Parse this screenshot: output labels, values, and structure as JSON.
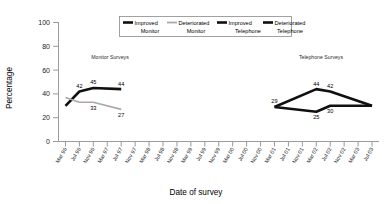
{
  "chart_data": {
    "type": "line",
    "title": "",
    "xlabel": "Date of survey",
    "ylabel": "Percentage",
    "ylim": [
      0,
      100
    ],
    "yticks": [
      0,
      20,
      40,
      60,
      80,
      100
    ],
    "grid": false,
    "legend_position": "top-center",
    "x": [
      "Mar 96",
      "Jul 96",
      "Nov 96",
      "Mar 97",
      "Jul 97",
      "Nov 97",
      "Mar 98",
      "Jul 98",
      "Nov 98",
      "Mar 99",
      "Jul 99",
      "Nov 99",
      "Mar 00",
      "Jul 00",
      "Nov 00",
      "Mar 01",
      "Jul 01",
      "Nov 01",
      "Mar 02",
      "Jul 02",
      "Nov 02",
      "Mar 03",
      "Jul 03"
    ],
    "annotations": [
      {
        "text": "Monitor Surveys",
        "x": "Nov 96"
      },
      {
        "text": "Telephone Surveys",
        "x": "Nov 01"
      }
    ],
    "series": [
      {
        "name": "Improved Monitor",
        "style": "thick-black",
        "points": [
          {
            "x": "Mar 96",
            "y": 30,
            "label": ""
          },
          {
            "x": "Jul 96",
            "y": 42,
            "label": "42"
          },
          {
            "x": "Nov 96",
            "y": 45,
            "label": "45"
          },
          {
            "x": "Jul 97",
            "y": 44,
            "label": "44"
          }
        ]
      },
      {
        "name": "Deteriorated Monitor",
        "style": "thin-grey",
        "points": [
          {
            "x": "Mar 96",
            "y": 37,
            "label": ""
          },
          {
            "x": "Jul 96",
            "y": 33,
            "label": ""
          },
          {
            "x": "Nov 96",
            "y": 33,
            "label": "33"
          },
          {
            "x": "Jul 97",
            "y": 27,
            "label": "27"
          }
        ]
      },
      {
        "name": "Improved Telephone",
        "style": "thick-black",
        "points": [
          {
            "x": "Mar 01",
            "y": 29,
            "label": "29"
          },
          {
            "x": "Mar 02",
            "y": 44,
            "label": "44"
          },
          {
            "x": "Jul 02",
            "y": 42,
            "label": "42"
          },
          {
            "x": "Jul 03",
            "y": 30,
            "label": ""
          }
        ]
      },
      {
        "name": "Deteriorated Telephone",
        "style": "thick-black",
        "points": [
          {
            "x": "Mar 01",
            "y": 29,
            "label": ""
          },
          {
            "x": "Mar 02",
            "y": 25,
            "label": "25"
          },
          {
            "x": "Jul 02",
            "y": 30,
            "label": "30"
          },
          {
            "x": "Jul 03",
            "y": 30,
            "label": ""
          }
        ]
      }
    ]
  },
  "legend": {
    "entries": [
      {
        "line1": "Improved",
        "line2": "Monitor",
        "marker": "thick-black-line-marker"
      },
      {
        "line1": "Deteriorated",
        "line2": "Monitor",
        "marker": "thin-grey-line-marker"
      },
      {
        "line1": "Improved",
        "line2": "Telephone",
        "marker": "thick-black-line-marker"
      },
      {
        "line1": "Deteriorated",
        "line2": "Telephone",
        "marker": "thick-black-line-marker"
      }
    ]
  },
  "colors": {
    "improved": "#101010",
    "deteriorated_monitor": "#a9a9a9",
    "axis": "#9a9a9a",
    "text": "#000000",
    "background": "#ffffff"
  }
}
